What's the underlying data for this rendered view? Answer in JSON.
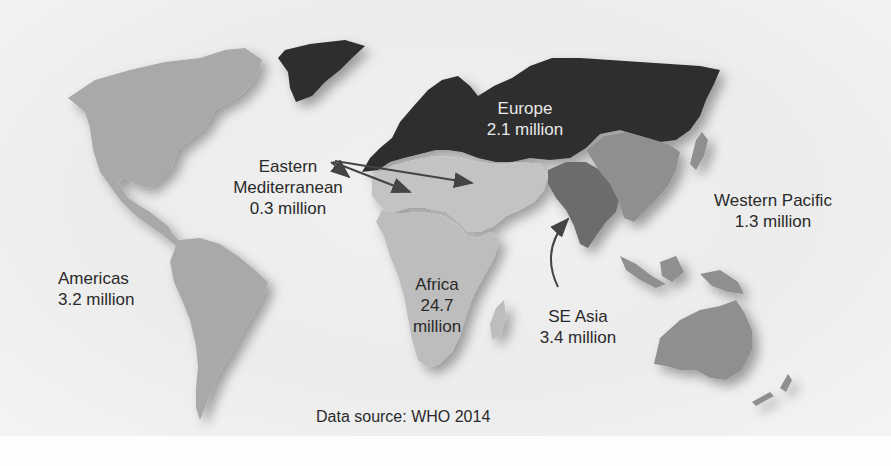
{
  "map": {
    "regions": [
      {
        "id": "americas",
        "name": "Americas",
        "value": "3.2 million",
        "shade": "#a9a9a9"
      },
      {
        "id": "eastern_mediterranean",
        "name_line1": "Eastern",
        "name_line2": "Mediterranean",
        "value": "0.3 million",
        "shade": "#c3c3c3"
      },
      {
        "id": "europe",
        "name": "Europe",
        "value": "2.1 million",
        "shade": "#2e2e2e"
      },
      {
        "id": "africa",
        "name": "Africa",
        "value_line1": "24.7",
        "value_line2": "million",
        "shade": "#bdbdbd"
      },
      {
        "id": "se_asia",
        "name": "SE Asia",
        "value": "3.4 million",
        "shade": "#6c6c6c"
      },
      {
        "id": "western_pacific",
        "name": "Western Pacific",
        "value": "1.3 million",
        "shade": "#8f8f8f"
      }
    ],
    "source": "Data source: WHO 2014",
    "colors": {
      "background": "#ededed",
      "text": "#2a2a2a",
      "europe_text": "#e8e8e8",
      "arrow": "#444444"
    }
  }
}
